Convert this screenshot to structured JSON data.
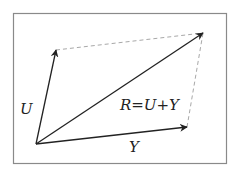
{
  "diagram": {
    "type": "vector-addition-parallelogram",
    "labels": {
      "u": "U",
      "y": "Y",
      "r": "R=U+Y"
    },
    "colors": {
      "frame": "#8a8a8a",
      "vector": "#222222",
      "dashed": "#a8a8a8",
      "background": "#ffffff"
    },
    "vectors": [
      {
        "name": "U",
        "from": [
          36,
          144
        ],
        "to": [
          56,
          50
        ]
      },
      {
        "name": "Y",
        "from": [
          36,
          144
        ],
        "to": [
          187,
          127
        ]
      },
      {
        "name": "R",
        "from": [
          36,
          144
        ],
        "to": [
          203,
          33
        ]
      }
    ],
    "dashed_lines": [
      {
        "from": [
          56,
          50
        ],
        "to": [
          203,
          33
        ]
      },
      {
        "from": [
          187,
          127
        ],
        "to": [
          203,
          33
        ]
      }
    ]
  }
}
